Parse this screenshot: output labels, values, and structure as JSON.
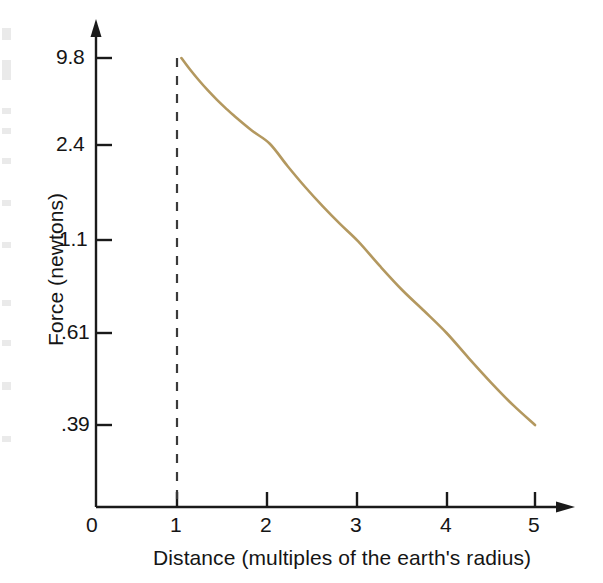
{
  "chart_data": {
    "type": "line",
    "title": "",
    "xlabel": "Distance   (multiples of the earth's radius)",
    "ylabel": "Force  (newtons)",
    "xlabel_main": "Distance",
    "xlabel_paren": "(multiples of the earth's radius)",
    "xticks": [
      "0",
      "1",
      "2",
      "3",
      "4",
      "5"
    ],
    "xtick_values": [
      0,
      1,
      2,
      3,
      4,
      5
    ],
    "yticks": [
      "9.8",
      "2.4",
      "1.1",
      ".61",
      ".39"
    ],
    "ytick_values": [
      9.8,
      2.4,
      1.1,
      0.61,
      0.39
    ],
    "xlim": [
      0,
      5
    ],
    "grid": false,
    "legend": null,
    "axis_style": "arrow-terminated",
    "y_scale": "nonlinear (inverse-square spacing)",
    "curve": {
      "name": "Gravitational force vs distance",
      "color": "#b3985f",
      "relation": "F = 9.8 / r^2",
      "x": [
        1.0,
        1.1,
        1.2,
        1.3,
        1.4,
        1.5,
        1.6,
        1.8,
        2.0,
        2.2,
        2.4,
        2.6,
        2.8,
        3.0,
        3.25,
        3.5,
        3.75,
        4.0,
        4.25,
        4.5,
        4.75,
        5.0
      ],
      "y": [
        9.8,
        8.1,
        6.81,
        5.8,
        5.0,
        4.36,
        3.83,
        3.02,
        2.45,
        2.02,
        1.7,
        1.45,
        1.25,
        1.09,
        0.93,
        0.8,
        0.7,
        0.61,
        0.54,
        0.48,
        0.43,
        0.39
      ]
    },
    "marker_line": {
      "name": "earth-surface-reference",
      "x": 1,
      "style": "dashed",
      "color": "#3a3a3a"
    },
    "annotations": []
  },
  "figure": {
    "background": "#ffffff",
    "axis_color": "#1a1a1a",
    "curve_color": "#b3985f"
  }
}
